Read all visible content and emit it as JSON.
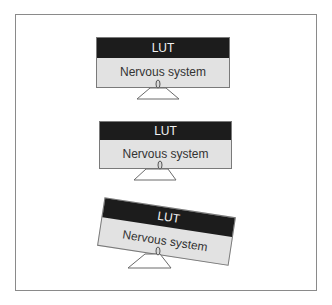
{
  "diagram": {
    "type": "monitor-stack",
    "colors": {
      "band": "#1c1c1c",
      "band_text": "#f2f2f2",
      "body": "#e2e2e2",
      "body_text": "#333333",
      "border": "#7a7a7a",
      "frame": "#8a8a8a"
    },
    "monitors": [
      {
        "band_label": "LUT",
        "body_label": "Nervous system",
        "tilt_deg": 0
      },
      {
        "band_label": "LUT",
        "body_label": "Nervous system",
        "tilt_deg": 0
      },
      {
        "band_label": "LUT",
        "body_label": "Nervous system",
        "tilt_deg": 8.7
      }
    ]
  }
}
